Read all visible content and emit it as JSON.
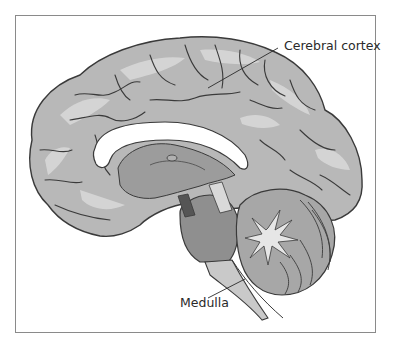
{
  "figure": {
    "labels": {
      "cerebral_cortex": "Cerebral cortex",
      "medulla": "Medulla"
    },
    "colors": {
      "cortex_fill": "#b5b5b5",
      "cortex_highlight": "#d9d9d9",
      "sulcus_line": "#3a3a3a",
      "corpus_callosum": "#ffffff",
      "brainstem": "#8f8f8f",
      "medulla": "#c8c8c8",
      "cerebellum": "#a8a8a8",
      "frame_border": "#8a8a8a"
    }
  }
}
